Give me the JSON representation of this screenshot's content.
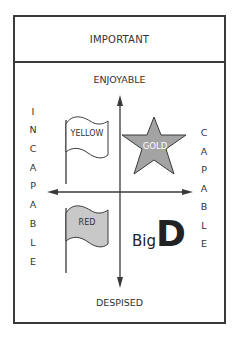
{
  "header": {
    "title": "IMPORTANT"
  },
  "axes": {
    "top": "ENJOYABLE",
    "bottom": "DESPISED",
    "left": [
      "I",
      "N",
      "C",
      "A",
      "P",
      "A",
      "B",
      "L",
      "E"
    ],
    "right": [
      "C",
      "A",
      "P",
      "A",
      "B",
      "L",
      "E"
    ]
  },
  "quadrants": {
    "top_left": {
      "shape": "flag",
      "label": "YELLOW",
      "fill": "#ffffff"
    },
    "top_right": {
      "shape": "star",
      "label": "GOLD",
      "fill": "#a3a3a3"
    },
    "bottom_left": {
      "shape": "flag",
      "label": "RED",
      "fill": "#c8c8c8"
    },
    "bottom_right": {
      "label_small": "Big",
      "label_big": "D"
    }
  },
  "colors": {
    "line": "#3a3a3a",
    "star_fill": "#a3a3a3",
    "red_flag_fill": "#c8c8c8"
  }
}
